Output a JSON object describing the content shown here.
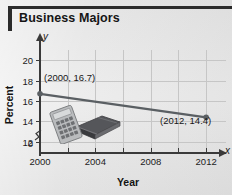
{
  "title": "Business Majors",
  "chart_data": {
    "type": "line",
    "title": "Business Majors",
    "xlabel": "Year",
    "ylabel": "Percent",
    "x": [
      2000,
      2012
    ],
    "values": [
      16.7,
      14.4
    ],
    "series": [
      {
        "name": "Percent of business majors",
        "values": [
          16.7,
          14.4
        ]
      }
    ],
    "point_labels": [
      "(2000, 16.7)",
      "(2012, 14.4)"
    ],
    "xlim": [
      2000,
      2013
    ],
    "ylim": [
      11,
      21
    ],
    "y_axis_break": true,
    "xticks": [
      2000,
      2004,
      2008,
      2012
    ],
    "xtick_labels": [
      "2000",
      "2004",
      "2008",
      "2012"
    ],
    "xminor_ticks": [
      2002,
      2006,
      2010
    ],
    "yticks": [
      12,
      14,
      16,
      18,
      20
    ],
    "ytick_labels": [
      "12",
      "14",
      "16",
      "18",
      "20"
    ],
    "y_origin_label": "0",
    "grid": true,
    "legend": "none",
    "x_axis_letter": "x",
    "y_axis_letter": "y",
    "line_color": "#5a5f63",
    "marker_color": "#5a5f63",
    "grid_color": "#c6c6c6",
    "axis_color": "#3a3a3a",
    "accent_color": "#2b2b2b"
  },
  "clipart": {
    "calculator": "calculator-icon",
    "book": "book-icon"
  }
}
